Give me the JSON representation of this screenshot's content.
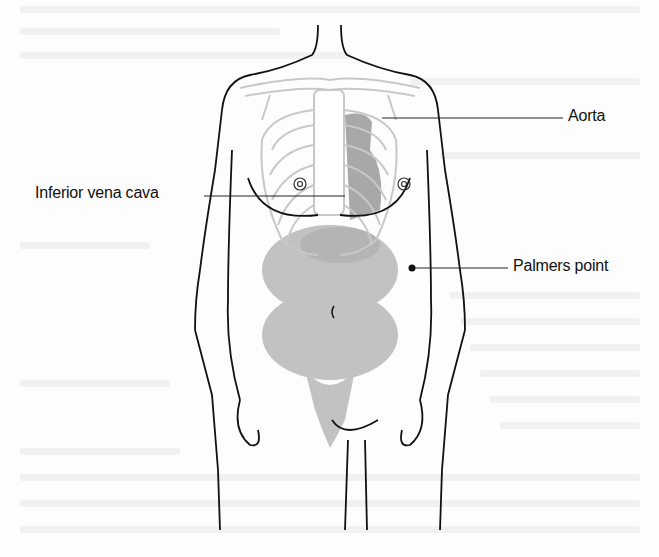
{
  "diagram": {
    "labels": [
      {
        "id": "aorta",
        "text": "Aorta",
        "x": 568,
        "y": 107
      },
      {
        "id": "ivc",
        "text": "Inferior vena cava",
        "x": 35,
        "y": 184
      },
      {
        "id": "palmers",
        "text": "Palmers point",
        "x": 513,
        "y": 257
      }
    ],
    "leaders": [
      {
        "id": "aorta",
        "from": [
          382,
          118
        ],
        "to": [
          563,
          118
        ]
      },
      {
        "id": "ivc",
        "from": [
          204,
          196
        ],
        "to": [
          345,
          196
        ]
      },
      {
        "id": "palmers",
        "from": [
          412,
          268
        ],
        "to": [
          508,
          268
        ]
      }
    ],
    "colors": {
      "outline": "#111111",
      "skeleton": "#c8c8c8",
      "organs": "#bdbdbd",
      "heart": "#9a9a9a",
      "bleed_through": "#f1f1f1"
    }
  }
}
